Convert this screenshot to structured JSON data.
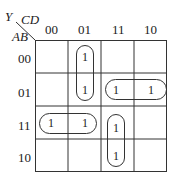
{
  "kmap": {
    "output_var": "Y",
    "col_vars": "CD",
    "row_vars": "AB",
    "col_labels": [
      "00",
      "01",
      "11",
      "10"
    ],
    "row_labels": [
      "00",
      "01",
      "11",
      "10"
    ],
    "cells": [
      [
        "",
        "1",
        "",
        ""
      ],
      [
        "",
        "1",
        "1",
        "1"
      ],
      [
        "1",
        "1",
        "1",
        ""
      ],
      [
        "",
        "",
        "1",
        ""
      ]
    ],
    "groups": [
      {
        "name": "A'BD' ... group col01 rows00-01",
        "cells": [
          [
            0,
            1
          ],
          [
            1,
            1
          ]
        ]
      },
      {
        "name": "group row01 cols11-10",
        "cells": [
          [
            1,
            2
          ],
          [
            1,
            3
          ]
        ]
      },
      {
        "name": "group row11 cols00-01",
        "cells": [
          [
            2,
            0
          ],
          [
            2,
            1
          ]
        ]
      },
      {
        "name": "group col11 rows11-10",
        "cells": [
          [
            2,
            2
          ],
          [
            3,
            2
          ]
        ]
      }
    ]
  }
}
